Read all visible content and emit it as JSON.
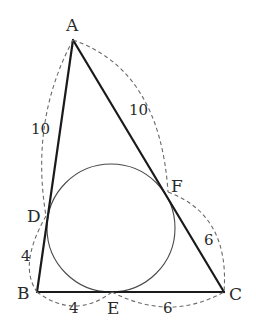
{
  "diagram": {
    "type": "triangle-with-incircle",
    "vertices": {
      "A": {
        "label": "A",
        "x": 73,
        "y": 40
      },
      "B": {
        "label": "B",
        "x": 37,
        "y": 292
      },
      "C": {
        "label": "C",
        "x": 224,
        "y": 292
      }
    },
    "tangent_points": {
      "D": {
        "label": "D",
        "x": 46,
        "y": 216,
        "on_side": "AB"
      },
      "E": {
        "label": "E",
        "x": 112,
        "y": 292,
        "on_side": "BC"
      },
      "F": {
        "label": "F",
        "x": 168,
        "y": 192,
        "on_side": "AC"
      }
    },
    "incircle": {
      "cx": 111,
      "cy": 228,
      "r": 64
    },
    "segment_lengths": {
      "AD": "10",
      "AF": "10",
      "BD": "4",
      "BE": "4",
      "CE": "6",
      "CF": "6"
    },
    "colors": {
      "sides": "#1a1a1a",
      "incircle": "#4a4a4a",
      "dashed_arcs": "#6a6a6a",
      "labels": "#2a2a2a",
      "background": "#ffffff"
    }
  }
}
